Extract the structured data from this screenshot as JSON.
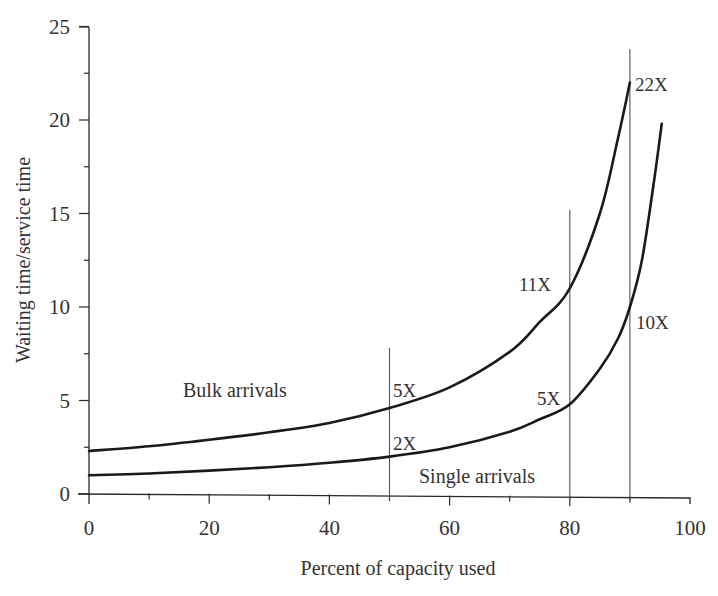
{
  "chart_data": {
    "type": "line",
    "title": "",
    "xlabel": "Percent of capacity used",
    "ylabel": "Waiting time/service time",
    "xlim": [
      0,
      100
    ],
    "ylim": [
      0,
      25
    ],
    "x_ticks": [
      "0",
      "20",
      "40",
      "60",
      "80",
      "100"
    ],
    "x_tick_values": [
      0,
      20,
      40,
      60,
      80,
      100
    ],
    "x_minor_ticks": [
      10,
      30,
      50,
      70,
      90
    ],
    "y_ticks": [
      "0",
      "5",
      "10",
      "15",
      "20",
      "25"
    ],
    "y_tick_values": [
      0,
      5,
      10,
      15,
      20,
      25
    ],
    "y_minor_ticks": [
      2.5,
      7.5,
      12.5,
      17.5,
      22.5
    ],
    "grid": false,
    "legend": "none (series labeled inline)",
    "series": [
      {
        "name": "Bulk arrivals",
        "x": [
          0,
          10,
          20,
          30,
          40,
          50,
          60,
          70,
          75,
          80,
          85,
          88,
          90
        ],
        "values": [
          2.3,
          2.55,
          2.9,
          3.3,
          3.8,
          4.6,
          5.7,
          7.6,
          9.2,
          11.0,
          15.0,
          19.0,
          22.0
        ]
      },
      {
        "name": "Single arrivals",
        "x": [
          0,
          10,
          20,
          30,
          40,
          50,
          60,
          70,
          75,
          80,
          85,
          88,
          90,
          92,
          94,
          95.3
        ],
        "values": [
          1.0,
          1.1,
          1.25,
          1.43,
          1.67,
          2.0,
          2.5,
          3.33,
          4.0,
          4.8,
          6.7,
          8.3,
          10.0,
          12.5,
          16.7,
          19.8
        ]
      }
    ],
    "reference_lines": [
      {
        "x": 50,
        "top": 7.8
      },
      {
        "x": 80,
        "top": 15.2
      },
      {
        "x": 90,
        "top": 23.8
      }
    ],
    "annotations": [
      {
        "text": "5X",
        "x": 50,
        "y": 4.6,
        "series": "Bulk arrivals"
      },
      {
        "text": "2X",
        "x": 50,
        "y": 2.0,
        "series": "Single arrivals"
      },
      {
        "text": "11X",
        "x": 80,
        "y": 11.0,
        "series": "Bulk arrivals"
      },
      {
        "text": "5X",
        "x": 80,
        "y": 4.8,
        "series": "Single arrivals"
      },
      {
        "text": "22X",
        "x": 90,
        "y": 22.0,
        "series": "Bulk arrivals"
      },
      {
        "text": "10X",
        "x": 90,
        "y": 10.0,
        "series": "Single arrivals"
      }
    ]
  }
}
